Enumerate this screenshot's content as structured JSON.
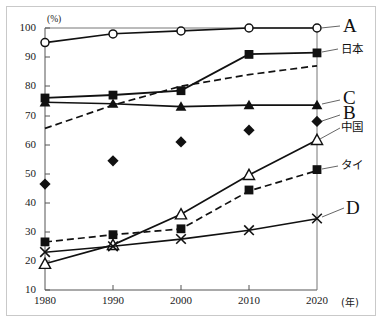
{
  "chart_data": {
    "type": "line",
    "title": "",
    "xlabel": "(年)",
    "ylabel": "(%)",
    "x": [
      1980,
      1990,
      2000,
      2010,
      2020
    ],
    "xticklabels": [
      "1980",
      "1990",
      "2000",
      "2010",
      "2020"
    ],
    "yticklabels": [
      "10",
      "20",
      "30",
      "40",
      "50",
      "60",
      "70",
      "80",
      "90",
      "100"
    ],
    "yticks": [
      10,
      20,
      30,
      40,
      50,
      60,
      70,
      80,
      90,
      100
    ],
    "ylim": [
      10,
      100
    ],
    "xlim": [
      1980,
      2020
    ],
    "grid": false,
    "legend_position": "right-inline",
    "series": [
      {
        "name": "A",
        "label": "A",
        "marker": "open-circle",
        "linestyle": "solid",
        "values": [
          95,
          98,
          99,
          100,
          100
        ],
        "label_y": 100
      },
      {
        "name": "日本",
        "label": "日本",
        "marker": "filled-square",
        "linestyle": "solid",
        "values": [
          76,
          77,
          78.5,
          91,
          91.5
        ],
        "label_y": 91.5
      },
      {
        "name": "B",
        "label": "B",
        "marker": "filled-diamond",
        "linestyle": "dashed",
        "values": [
          65.5,
          73.5,
          80,
          84,
          87
        ],
        "label_y": 87
      },
      {
        "name": "C",
        "label": "C",
        "marker": "filled-triangle",
        "linestyle": "solid",
        "values": [
          74.5,
          74,
          73,
          73.5,
          73.5
        ],
        "label_y": 73.5
      },
      {
        "name": "中国",
        "label": "中国",
        "marker": "open-triangle",
        "linestyle": "solid",
        "values": [
          19,
          25.5,
          36,
          49.5,
          61.5
        ],
        "label_y": 61.5
      },
      {
        "name": "タイ",
        "label": "タイ",
        "marker": "filled-square",
        "linestyle": "dashed",
        "values": [
          26.5,
          29,
          31,
          44,
          51
        ],
        "label_y": 51
      },
      {
        "name": "D",
        "label": "D",
        "marker": "cross-x",
        "linestyle": "solid",
        "values": [
          23,
          25,
          27.5,
          30.5,
          34.5
        ],
        "label_y": 34.5
      }
    ],
    "colors": {
      "line": "#111111",
      "axis": "#3a3a3a",
      "text": "#101010",
      "frame": "#c9c9c9",
      "background": "#ffffff"
    }
  },
  "axis": {
    "y_unit": "(%)",
    "x_unit": "(年)",
    "yticklabels": [
      "100",
      "90",
      "80",
      "70",
      "60",
      "50",
      "40",
      "30",
      "20",
      "10"
    ],
    "xticklabels": [
      "1980",
      "1990",
      "2000",
      "2010",
      "2020"
    ]
  },
  "labels": {
    "a": "A",
    "japan": "日本",
    "b": "B",
    "c": "C",
    "china": "中国",
    "thailand": "タイ",
    "d": "D"
  },
  "caption": ""
}
